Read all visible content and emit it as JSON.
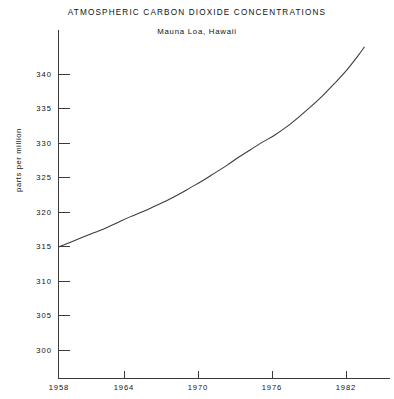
{
  "chart_data": {
    "type": "line",
    "title": "ATMOSPHERIC CARBON DIOXIDE CONCENTRATIONS",
    "subtitle": "Mauna Loa, Hawaii",
    "xlabel": "",
    "ylabel": "parts per million",
    "xlim": [
      1958,
      1983.5
    ],
    "ylim": [
      298,
      344
    ],
    "grid": false,
    "legend": null,
    "x_ticks": [
      1958,
      1964,
      1970,
      1976,
      1982
    ],
    "x_tick_labels": [
      "1958",
      "1964",
      "1970",
      "1976",
      "1982"
    ],
    "y_ticks": [
      300,
      305,
      310,
      315,
      320,
      325,
      330,
      335,
      340
    ],
    "y_tick_labels": [
      "300",
      "305",
      "310",
      "315",
      "320",
      "325",
      "330",
      "335",
      "340"
    ],
    "series": [
      {
        "name": "CO2 concentration",
        "color": "#3a3a3a",
        "x": [
          1958,
          1959,
          1960,
          1961,
          1962,
          1963,
          1964,
          1965,
          1966,
          1967,
          1968,
          1969,
          1970,
          1971,
          1972,
          1973,
          1974,
          1975,
          1976,
          1977,
          1978,
          1979,
          1980,
          1981,
          1982,
          1983,
          1983.5
        ],
        "values": [
          315.0,
          315.7,
          316.4,
          317.1,
          317.8,
          318.6,
          319.4,
          320.1,
          320.9,
          321.7,
          322.6,
          323.6,
          324.6,
          325.7,
          326.8,
          328.0,
          329.1,
          330.2,
          331.2,
          332.4,
          333.8,
          335.3,
          336.9,
          338.7,
          340.6,
          342.8,
          344.0
        ]
      }
    ]
  },
  "axes": {
    "y_axis_name": "y-axis",
    "x_axis_name": "x-axis"
  }
}
